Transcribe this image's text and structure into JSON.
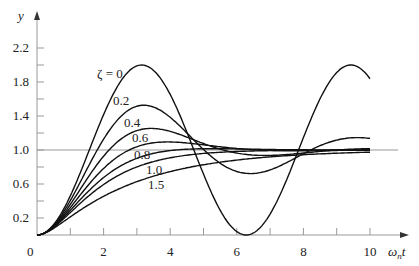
{
  "chart_data": {
    "type": "line",
    "title": "",
    "xlabel": "ωnt",
    "ylabel": "y",
    "xlim": [
      0,
      10
    ],
    "ylim": [
      0,
      2.4
    ],
    "x_ticks": [
      0,
      2,
      4,
      6,
      8,
      10
    ],
    "x_minor_ticks": [
      1,
      3,
      5,
      7,
      9
    ],
    "y_tick_labels": [
      "0.2",
      "0.6",
      "1.0",
      "1.4",
      "1.8",
      "2.2"
    ],
    "y_ticks": [
      0.2,
      0.4,
      0.6,
      0.8,
      1.0,
      1.2,
      1.4,
      1.6,
      1.8,
      2.0,
      2.2
    ],
    "reference_line": 1.0,
    "grid": false,
    "legend": "inline labels",
    "series": [
      {
        "name": "ζ = 0",
        "zeta": 0.0,
        "label": "ζ = 0"
      },
      {
        "name": "0.2",
        "zeta": 0.2,
        "label": "0.2"
      },
      {
        "name": "0.4",
        "zeta": 0.4,
        "label": "0.4"
      },
      {
        "name": "0.6",
        "zeta": 0.6,
        "label": "0.6"
      },
      {
        "name": "0.8",
        "zeta": 0.8,
        "label": "0.8"
      },
      {
        "name": "1.0",
        "zeta": 1.0,
        "label": "1.0"
      },
      {
        "name": "1.5",
        "zeta": 1.5,
        "label": "1.5"
      }
    ],
    "label_positions": [
      {
        "x": 97,
        "y": 78
      },
      {
        "x": 113,
        "y": 105
      },
      {
        "x": 124,
        "y": 127
      },
      {
        "x": 132,
        "y": 142
      },
      {
        "x": 134,
        "y": 159
      },
      {
        "x": 146,
        "y": 174
      },
      {
        "x": 148,
        "y": 189
      }
    ]
  },
  "axes": {
    "y_label": "y",
    "x_label_main": "ω",
    "x_label_sub": "n",
    "x_label_tail": "t",
    "zero_label": "0"
  }
}
